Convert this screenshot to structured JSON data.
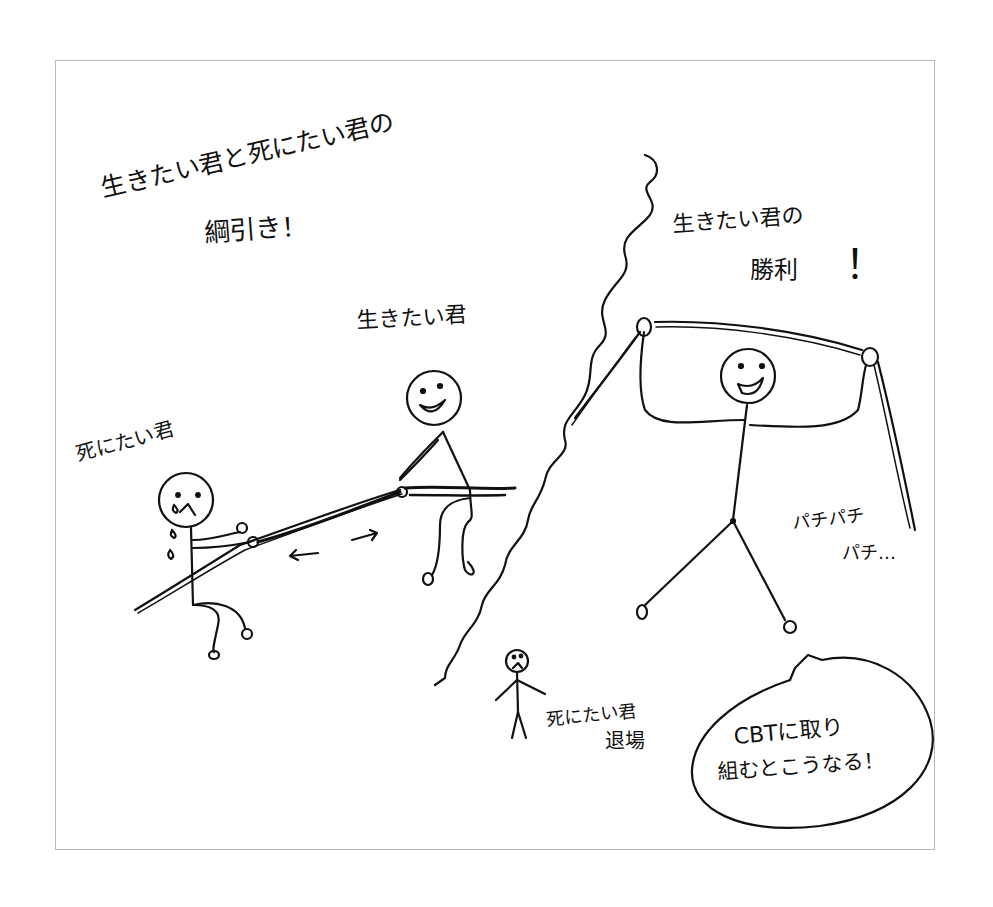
{
  "illustration": {
    "title_line1": "生きたい君と死にたい君の",
    "title_line2": "綱引き！",
    "left_scene": {
      "label_live": "生きたい君",
      "label_die": "死にたい君",
      "arrow_left": "←",
      "arrow_right": "→"
    },
    "right_scene": {
      "victory_line1": "生きたい君の",
      "victory_line2": "勝利",
      "victory_mark": "！",
      "clap_line1": "パチパチ",
      "clap_line2": "パチ…",
      "exit_line1": "死にたい君",
      "exit_line2": "退場"
    },
    "speech_bubble": {
      "line1": "CBTに取り",
      "line2": "組むとこうなる！"
    },
    "colors": {
      "ink": "#111111",
      "frame": "#b8b8b8",
      "paper": "#ffffff"
    }
  }
}
